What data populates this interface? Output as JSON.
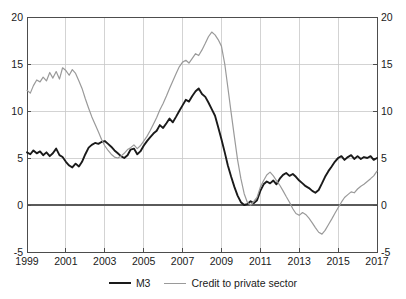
{
  "chart_data": {
    "type": "line",
    "title": "",
    "subtitle": "",
    "xlabel": "",
    "ylabel": "",
    "xlim": [
      1999.0,
      2017.0
    ],
    "ylim": [
      -5,
      20
    ],
    "yticks": [
      -5,
      0,
      5,
      10,
      15,
      20
    ],
    "xticks": [
      1999,
      2001,
      2003,
      2005,
      2007,
      2009,
      2011,
      2013,
      2015,
      2017
    ],
    "ytick_labels": [
      "-5",
      "0",
      "5",
      "10",
      "15",
      "20"
    ],
    "xtick_labels": [
      "1999",
      "2001",
      "2003",
      "2005",
      "2007",
      "2009",
      "2011",
      "2013",
      "2015",
      "2017"
    ],
    "grid": true,
    "grid_axis": "both",
    "zero_line": 0,
    "dual_y_axis": true,
    "legend_position": "bottom-center",
    "series": [
      {
        "name": "M3",
        "color": "#1a1a1a",
        "width": 1.9,
        "x": [
          1999.0,
          1999.17,
          1999.33,
          1999.5,
          1999.67,
          1999.83,
          2000.0,
          2000.17,
          2000.33,
          2000.5,
          2000.67,
          2000.83,
          2001.0,
          2001.17,
          2001.33,
          2001.5,
          2001.67,
          2001.83,
          2002.0,
          2002.17,
          2002.33,
          2002.5,
          2002.67,
          2002.83,
          2003.0,
          2003.17,
          2003.33,
          2003.5,
          2003.67,
          2003.83,
          2004.0,
          2004.17,
          2004.33,
          2004.5,
          2004.67,
          2004.83,
          2005.0,
          2005.17,
          2005.33,
          2005.5,
          2005.67,
          2005.83,
          2006.0,
          2006.17,
          2006.33,
          2006.5,
          2006.67,
          2006.83,
          2007.0,
          2007.17,
          2007.33,
          2007.5,
          2007.67,
          2007.83,
          2008.0,
          2008.17,
          2008.33,
          2008.5,
          2008.67,
          2008.83,
          2009.0,
          2009.17,
          2009.33,
          2009.5,
          2009.67,
          2009.83,
          2010.0,
          2010.17,
          2010.33,
          2010.5,
          2010.67,
          2010.83,
          2011.0,
          2011.17,
          2011.33,
          2011.5,
          2011.67,
          2011.83,
          2012.0,
          2012.17,
          2012.33,
          2012.5,
          2012.67,
          2012.83,
          2013.0,
          2013.17,
          2013.33,
          2013.5,
          2013.67,
          2013.83,
          2014.0,
          2014.17,
          2014.33,
          2014.5,
          2014.67,
          2014.83,
          2015.0,
          2015.17,
          2015.33,
          2015.5,
          2015.67,
          2015.83,
          2016.0,
          2016.17,
          2016.33,
          2016.5,
          2016.67,
          2016.83,
          2017.0
        ],
        "values": [
          5.6,
          5.4,
          5.8,
          5.5,
          5.7,
          5.3,
          5.6,
          5.2,
          5.5,
          6.0,
          5.3,
          5.1,
          4.6,
          4.2,
          4.0,
          4.4,
          4.1,
          4.6,
          5.4,
          6.1,
          6.4,
          6.6,
          6.5,
          6.7,
          6.8,
          6.5,
          6.2,
          5.8,
          5.5,
          5.2,
          5.0,
          5.3,
          5.9,
          6.0,
          5.4,
          5.7,
          6.3,
          6.8,
          7.2,
          7.6,
          7.9,
          8.5,
          8.2,
          8.7,
          9.2,
          8.8,
          9.4,
          10.0,
          10.6,
          11.2,
          11.0,
          11.6,
          12.1,
          12.4,
          11.8,
          11.5,
          10.9,
          10.2,
          9.5,
          8.3,
          7.0,
          5.6,
          4.2,
          3.0,
          1.9,
          1.0,
          0.3,
          0.0,
          0.1,
          0.4,
          0.2,
          0.5,
          1.5,
          2.2,
          2.5,
          2.3,
          2.6,
          2.2,
          2.8,
          3.2,
          3.4,
          3.1,
          3.3,
          3.0,
          2.6,
          2.3,
          2.0,
          1.8,
          1.5,
          1.3,
          1.6,
          2.3,
          3.0,
          3.6,
          4.1,
          4.6,
          5.0,
          5.2,
          4.8,
          5.1,
          5.3,
          4.9,
          5.2,
          4.9,
          5.1,
          5.0,
          5.2,
          4.8,
          5.0
        ]
      },
      {
        "name": "Credit to private sector",
        "color": "#9a9a9a",
        "width": 1.2,
        "x": [
          1999.0,
          1999.17,
          1999.33,
          1999.5,
          1999.67,
          1999.83,
          2000.0,
          2000.17,
          2000.33,
          2000.5,
          2000.67,
          2000.83,
          2001.0,
          2001.17,
          2001.33,
          2001.5,
          2001.67,
          2001.83,
          2002.0,
          2002.17,
          2002.33,
          2002.5,
          2002.67,
          2002.83,
          2003.0,
          2003.17,
          2003.33,
          2003.5,
          2003.67,
          2003.83,
          2004.0,
          2004.17,
          2004.33,
          2004.5,
          2004.67,
          2004.83,
          2005.0,
          2005.17,
          2005.33,
          2005.5,
          2005.67,
          2005.83,
          2006.0,
          2006.17,
          2006.33,
          2006.5,
          2006.67,
          2006.83,
          2007.0,
          2007.17,
          2007.33,
          2007.5,
          2007.67,
          2007.83,
          2008.0,
          2008.17,
          2008.33,
          2008.5,
          2008.67,
          2008.83,
          2009.0,
          2009.17,
          2009.33,
          2009.5,
          2009.67,
          2009.83,
          2010.0,
          2010.17,
          2010.33,
          2010.5,
          2010.67,
          2010.83,
          2011.0,
          2011.17,
          2011.33,
          2011.5,
          2011.67,
          2011.83,
          2012.0,
          2012.17,
          2012.33,
          2012.5,
          2012.67,
          2012.83,
          2013.0,
          2013.17,
          2013.33,
          2013.5,
          2013.67,
          2013.83,
          2014.0,
          2014.17,
          2014.33,
          2014.5,
          2014.67,
          2014.83,
          2015.0,
          2015.17,
          2015.33,
          2015.5,
          2015.67,
          2015.83,
          2016.0,
          2016.17,
          2016.33,
          2016.5,
          2016.67,
          2016.83,
          2017.0
        ],
        "values": [
          12.2,
          11.9,
          12.7,
          13.3,
          13.1,
          13.6,
          13.2,
          14.1,
          13.5,
          14.2,
          13.4,
          14.6,
          14.3,
          13.8,
          14.4,
          14.0,
          13.2,
          12.4,
          11.3,
          10.3,
          9.4,
          8.6,
          7.8,
          7.0,
          6.3,
          5.8,
          5.4,
          5.1,
          5.0,
          5.2,
          5.5,
          5.9,
          6.1,
          6.4,
          6.0,
          6.3,
          6.8,
          7.3,
          7.9,
          8.6,
          9.3,
          10.1,
          10.8,
          11.6,
          12.4,
          13.2,
          14.0,
          14.7,
          15.2,
          15.4,
          15.1,
          15.6,
          16.1,
          15.9,
          16.5,
          17.2,
          17.9,
          18.4,
          18.1,
          17.6,
          16.9,
          15.0,
          12.5,
          9.8,
          7.2,
          4.8,
          2.8,
          1.2,
          0.3,
          0.0,
          0.4,
          0.8,
          1.9,
          2.6,
          3.2,
          3.5,
          3.1,
          2.6,
          2.1,
          1.5,
          0.9,
          0.3,
          -0.4,
          -0.9,
          -1.1,
          -0.8,
          -1.0,
          -1.4,
          -1.9,
          -2.4,
          -2.9,
          -3.1,
          -2.7,
          -2.1,
          -1.5,
          -0.9,
          -0.3,
          0.3,
          0.8,
          1.1,
          1.4,
          1.3,
          1.7,
          2.0,
          2.2,
          2.5,
          2.8,
          3.1,
          3.6
        ]
      }
    ]
  },
  "axes": {
    "left_axis_name": "left-value-axis",
    "right_axis_name": "right-value-axis",
    "bottom_axis_name": "year-axis"
  },
  "legend": {
    "items": [
      {
        "label": "M3",
        "icon": "line-swatch-black"
      },
      {
        "label": "Credit to private sector",
        "icon": "line-swatch-gray"
      }
    ]
  },
  "colors": {
    "m3": "#1a1a1a",
    "credit": "#9a9a9a",
    "grid": "#c8c8c8",
    "axis": "#4d4d4d",
    "zero": "#5a5a5a",
    "background": "#ffffff"
  }
}
